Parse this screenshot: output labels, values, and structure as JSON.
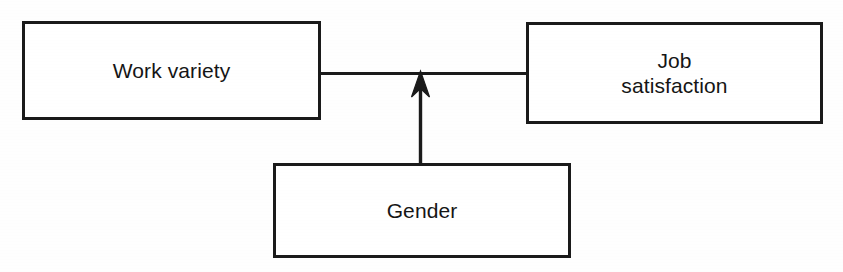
{
  "diagram": {
    "type": "path-model-diagram",
    "background_color": "#fefefe",
    "line_color": "#1a1a1a",
    "nodes": [
      {
        "id": "work-variety",
        "label": "Work variety",
        "x": 22,
        "y": 21,
        "width": 299,
        "height": 99
      },
      {
        "id": "job-satisfaction",
        "label": "Job\nsatisfaction",
        "x": 526,
        "y": 22,
        "width": 297,
        "height": 102
      },
      {
        "id": "gender",
        "label": "Gender",
        "x": 273,
        "y": 163,
        "width": 298,
        "height": 95
      }
    ],
    "connectors": [
      {
        "id": "work-variety-to-job-satisfaction",
        "from": "work-variety",
        "to": "job-satisfaction",
        "style": "plain-line",
        "orientation": "horizontal",
        "arrowhead": "none"
      },
      {
        "id": "gender-to-relationship",
        "from": "gender",
        "to": "work-variety-to-job-satisfaction",
        "style": "arrow",
        "orientation": "vertical",
        "arrowhead": "up"
      }
    ]
  }
}
